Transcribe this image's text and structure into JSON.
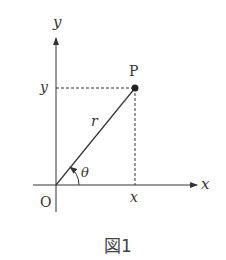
{
  "diagram": {
    "axis_labels": {
      "x": "x",
      "y": "y"
    },
    "origin_label": "O",
    "point_label": "P",
    "radius_label": "r",
    "angle_label": "θ",
    "x_tick_label": "x",
    "y_tick_label": "y",
    "caption": "図1",
    "colors": {
      "line": "#333333",
      "background": "#ffffff"
    }
  }
}
